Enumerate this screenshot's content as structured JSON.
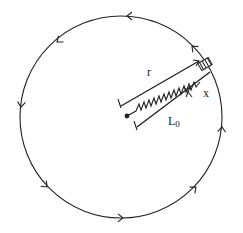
{
  "diagram": {
    "type": "rotating-spring-mass",
    "circle": {
      "cx": 121,
      "cy": 117,
      "r": 101,
      "direction": "counter-clockwise"
    },
    "labels": {
      "radius": "r",
      "extension": "x",
      "natural_length": "L",
      "natural_length_sub": "0"
    },
    "components": [
      "pivot-point",
      "spring",
      "mass-block",
      "circular-path",
      "direction-arrows"
    ],
    "arrow_count": 8,
    "colors": {
      "line": "#222222",
      "background": "#ffffff",
      "mass_fill": "#888888"
    }
  }
}
